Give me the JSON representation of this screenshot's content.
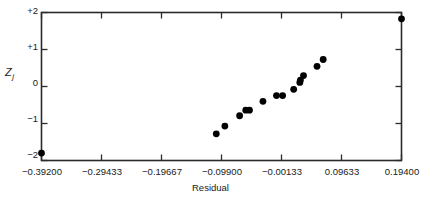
{
  "chart_data": {
    "type": "scatter",
    "title": "",
    "xlabel": "Residual",
    "ylabel": "Z",
    "ylabel_subscript": "j",
    "xlim": [
      -0.392,
      0.194
    ],
    "ylim": [
      -2,
      2
    ],
    "grid": false,
    "legend": null,
    "xticks": [
      -0.392,
      -0.29433,
      -0.19667,
      -0.099,
      -0.00133,
      0.09633,
      0.194
    ],
    "xticklabels": [
      "−0.39200",
      "−0.29433",
      "−0.19667",
      "−0.09900",
      "−0.00133",
      "0.09633",
      "0.19400"
    ],
    "yticks": [
      2,
      1,
      0,
      -1,
      -2
    ],
    "yticklabels": [
      "+2",
      "+1",
      "0",
      "−1",
      "−2"
    ],
    "marker": "filled-circle",
    "marker_color": "#000000",
    "marker_size": 3.4,
    "points": [
      {
        "x": -0.392,
        "y": -1.8
      },
      {
        "x": -0.1075,
        "y": -1.28
      },
      {
        "x": -0.0935,
        "y": -1.07
      },
      {
        "x": -0.0695,
        "y": -0.79
      },
      {
        "x": -0.0595,
        "y": -0.64
      },
      {
        "x": -0.0535,
        "y": -0.64
      },
      {
        "x": -0.0315,
        "y": -0.4
      },
      {
        "x": -0.0095,
        "y": -0.245
      },
      {
        "x": 0.0005,
        "y": -0.245
      },
      {
        "x": 0.0185,
        "y": -0.075
      },
      {
        "x": 0.0285,
        "y": 0.11
      },
      {
        "x": 0.0295,
        "y": 0.175
      },
      {
        "x": 0.0345,
        "y": 0.295
      },
      {
        "x": 0.0565,
        "y": 0.545
      },
      {
        "x": 0.0665,
        "y": 0.73
      },
      {
        "x": 0.194,
        "y": 1.83
      }
    ]
  },
  "axes": {
    "y_label_text": "Z",
    "y_label_sub": "j",
    "x_label_text": "Residual"
  }
}
